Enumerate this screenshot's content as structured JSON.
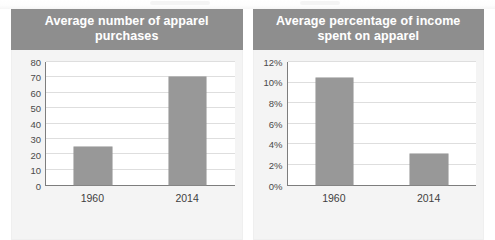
{
  "page": {
    "background_color": "#ffffff",
    "header_color": "#8e8e8e",
    "bar_color": "#989898",
    "panel_color": "#f4f4f4",
    "gridline_color": "#dedede",
    "axis_color": "#7d7d7d"
  },
  "charts": [
    {
      "panel_id": "apparel-purchases",
      "title": "Average number of apparel purchases",
      "title_line1": "Average number of apparel",
      "title_line2": "purchases",
      "chart_data": {
        "type": "bar",
        "title": "Average number of apparel purchases",
        "xlabel": "",
        "ylabel": "",
        "categories": [
          "1960",
          "2014"
        ],
        "values": [
          25,
          70
        ],
        "ylim": [
          0,
          80
        ],
        "yticks": [
          0,
          10,
          20,
          30,
          40,
          50,
          60,
          70,
          80
        ],
        "ytick_labels": [
          "0",
          "10",
          "20",
          "30",
          "40",
          "50",
          "60",
          "70",
          "80"
        ],
        "grid": true,
        "legend": false
      }
    },
    {
      "panel_id": "income-spent-on-apparel",
      "title": "Average percentage of income spent on apparel",
      "title_line1": "Average percentage of income",
      "title_line2": "spent on apparel",
      "chart_data": {
        "type": "bar",
        "title": "Average percentage of income spent on apparel",
        "xlabel": "",
        "ylabel": "",
        "categories": [
          "1960",
          "2014"
        ],
        "values": [
          10.4,
          3.0
        ],
        "ylim": [
          0,
          12
        ],
        "yticks": [
          0,
          2,
          4,
          6,
          8,
          10,
          12
        ],
        "ytick_labels": [
          "0%",
          "2%",
          "4%",
          "6%",
          "8%",
          "10%",
          "12%"
        ],
        "grid": true,
        "legend": false
      }
    }
  ]
}
